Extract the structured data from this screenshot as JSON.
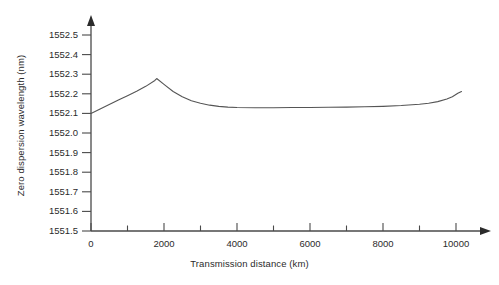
{
  "chart_data": {
    "type": "line",
    "title": "",
    "xlabel": "Transmission distance (km)",
    "ylabel": "Zero dispersion wavelength (nm)",
    "xlim": [
      0,
      10500
    ],
    "ylim": [
      1551.5,
      1552.5
    ],
    "grid": false,
    "legend": null,
    "x_ticks_major": [
      0,
      2000,
      4000,
      6000,
      8000,
      10000
    ],
    "x_tick_labels": [
      "0",
      "2000",
      "4000",
      "6000",
      "8000",
      "10000"
    ],
    "x_ticks_minor": [
      1000,
      3000,
      5000,
      7000,
      9000
    ],
    "y_ticks": [
      1551.5,
      1551.6,
      1551.7,
      1551.8,
      1551.9,
      1552.0,
      1552.1,
      1552.2,
      1552.3,
      1552.4,
      1552.5
    ],
    "y_tick_labels": [
      "1551.5",
      "1551.6",
      "1551.7",
      "1551.8",
      "1551.9",
      "1552.0",
      "1552.1",
      "1552.2",
      "1552.3",
      "1552.4",
      "1552.5"
    ],
    "series": [
      {
        "name": "zero dispersion wavelength",
        "color": "#555555",
        "x": [
          0,
          250,
          500,
          750,
          1000,
          1250,
          1500,
          1750,
          1800,
          2000,
          2250,
          2500,
          2750,
          3000,
          3250,
          3500,
          3750,
          4000,
          4500,
          5000,
          5500,
          6000,
          6500,
          7000,
          7500,
          8000,
          8500,
          9000,
          9250,
          9500,
          9750,
          9900,
          10050,
          10150
        ],
        "y": [
          1552.1,
          1552.122,
          1552.145,
          1552.168,
          1552.19,
          1552.213,
          1552.238,
          1552.268,
          1552.278,
          1552.248,
          1552.212,
          1552.185,
          1552.165,
          1552.152,
          1552.142,
          1552.136,
          1552.132,
          1552.13,
          1552.129,
          1552.129,
          1552.13,
          1552.13,
          1552.131,
          1552.132,
          1552.134,
          1552.136,
          1552.14,
          1552.147,
          1552.152,
          1552.16,
          1552.173,
          1552.185,
          1552.203,
          1552.212
        ]
      }
    ],
    "annotations": {
      "start_value": 1552.1,
      "peak_value": 1552.28,
      "peak_distance": 1800,
      "plateau_value": 1552.13,
      "end_value": 1552.21
    }
  },
  "axes": {
    "x_axis_name": "transmission-distance-axis",
    "y_axis_name": "zero-dispersion-wavelength-axis",
    "arrowheads": true,
    "axis_color": "#4a4a4a"
  }
}
